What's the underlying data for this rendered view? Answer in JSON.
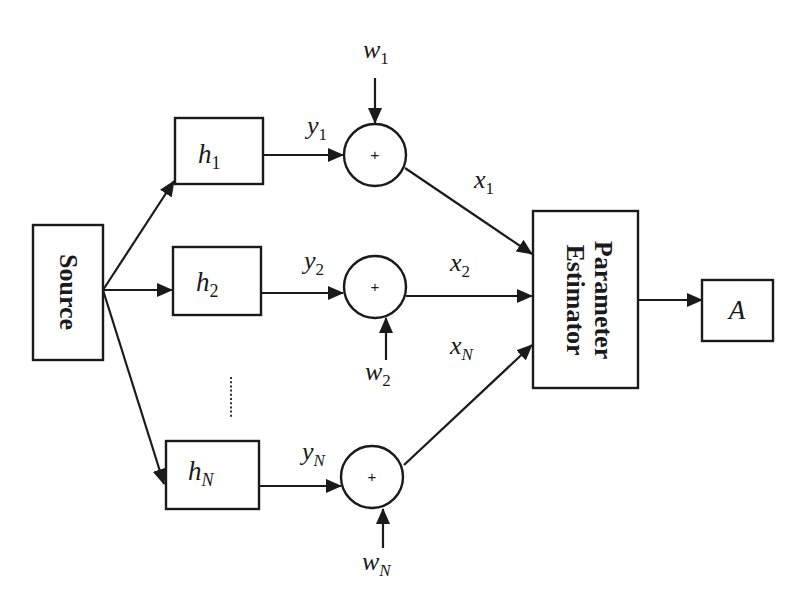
{
  "diagram": {
    "source": {
      "label": "Source"
    },
    "estimator": {
      "line1": "Parameter",
      "line2": "Estimator"
    },
    "output": {
      "label": "A"
    },
    "channels": [
      {
        "filter": {
          "base": "h",
          "sub": "1"
        },
        "filter_out": {
          "base": "y",
          "sub": "1"
        },
        "noise": {
          "base": "w",
          "sub": "1"
        },
        "summer_symbol": "+",
        "summer_out": {
          "base": "x",
          "sub": "1"
        }
      },
      {
        "filter": {
          "base": "h",
          "sub": "2"
        },
        "filter_out": {
          "base": "y",
          "sub": "2"
        },
        "noise": {
          "base": "w",
          "sub": "2"
        },
        "summer_symbol": "+",
        "summer_out": {
          "base": "x",
          "sub": "2"
        }
      },
      {
        "filter": {
          "base": "h",
          "sub": "N"
        },
        "filter_out": {
          "base": "y",
          "sub": "N"
        },
        "noise": {
          "base": "w",
          "sub": "N"
        },
        "summer_symbol": "+",
        "summer_out": {
          "base": "x",
          "sub": "N"
        }
      }
    ],
    "ellipsis": "vertical-dots",
    "colors": {
      "stroke": "#1a1a1a",
      "background": "#ffffff"
    }
  }
}
